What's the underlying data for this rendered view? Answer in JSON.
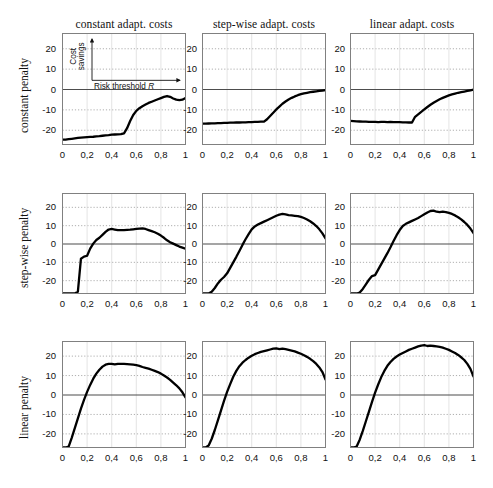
{
  "figure": {
    "col_titles": [
      "constant adapt. costs",
      "step-wise adapt. costs",
      "linear adapt. costs"
    ],
    "row_labels": [
      "constant penalty",
      "step-wise penalty",
      "linear penalty"
    ],
    "ytick_labels": [
      "20",
      "10",
      "0",
      "-10",
      "-20"
    ],
    "xtick_labels": [
      "0",
      "0,2",
      "0,4",
      "0,6",
      "0,8",
      "1"
    ],
    "inset": {
      "ylabel_line1": "Cost",
      "ylabel_line2": "savings",
      "xlabel": "Risk threshold R"
    },
    "colors": {
      "curve": "#000000",
      "axis": "#808080",
      "grid": "#9a9a9a",
      "zero_line": "#4d4d4d",
      "text": "#111111",
      "background": "#ffffff"
    }
  },
  "chart_data": {
    "type": "line",
    "xlabel": "Risk threshold R",
    "ylabel": "Cost savings",
    "xlim": [
      0,
      1
    ],
    "ylim": [
      -27,
      27
    ],
    "xticks": [
      0,
      0.2,
      0.4,
      0.6,
      0.8,
      1
    ],
    "yticks": [
      -20,
      -10,
      0,
      10,
      20
    ],
    "grid": true,
    "legend": "none",
    "grid_rows": [
      "constant penalty",
      "step-wise penalty",
      "linear penalty"
    ],
    "grid_cols": [
      "constant adapt. costs",
      "step-wise adapt. costs",
      "linear adapt. costs"
    ],
    "x": [
      0.0,
      0.025,
      0.05,
      0.075,
      0.1,
      0.125,
      0.15,
      0.175,
      0.2,
      0.225,
      0.25,
      0.275,
      0.3,
      0.325,
      0.35,
      0.375,
      0.4,
      0.425,
      0.45,
      0.475,
      0.5,
      0.525,
      0.55,
      0.575,
      0.6,
      0.625,
      0.65,
      0.675,
      0.7,
      0.725,
      0.75,
      0.775,
      0.8,
      0.825,
      0.85,
      0.875,
      0.9,
      0.925,
      0.95,
      0.975,
      1.0
    ],
    "panels": [
      {
        "row": "constant penalty",
        "col": "constant adapt. costs",
        "values": [
          -24.6,
          -24.6,
          -24.4,
          -24.2,
          -24.0,
          -23.8,
          -23.6,
          -23.5,
          -23.4,
          -23.3,
          -23.2,
          -23.0,
          -22.9,
          -22.7,
          -22.5,
          -22.4,
          -22.2,
          -22.1,
          -22.0,
          -21.9,
          -21.5,
          -19.0,
          -15.5,
          -12.5,
          -10.5,
          -9.2,
          -8.2,
          -7.4,
          -6.6,
          -6.0,
          -5.4,
          -4.8,
          -4.2,
          -3.6,
          -3.2,
          -3.6,
          -4.4,
          -5.0,
          -5.2,
          -5.0,
          -4.2
        ]
      },
      {
        "row": "constant penalty",
        "col": "step-wise adapt. costs",
        "values": [
          -16.8,
          -16.8,
          -16.7,
          -16.6,
          -16.6,
          -16.5,
          -16.5,
          -16.4,
          -16.4,
          -16.3,
          -16.3,
          -16.2,
          -16.2,
          -16.1,
          -16.1,
          -16.0,
          -16.0,
          -15.9,
          -15.9,
          -15.8,
          -15.8,
          -14.6,
          -13.0,
          -11.4,
          -9.8,
          -8.4,
          -7.0,
          -5.9,
          -4.9,
          -4.1,
          -3.4,
          -2.8,
          -2.3,
          -1.9,
          -1.6,
          -1.3,
          -1.1,
          -0.9,
          -0.7,
          -0.5,
          -0.3
        ]
      },
      {
        "row": "constant penalty",
        "col": "linear adapt. costs",
        "values": [
          -15.4,
          -15.5,
          -15.6,
          -15.7,
          -15.8,
          -15.8,
          -15.9,
          -15.9,
          -15.9,
          -16.0,
          -15.9,
          -15.9,
          -16.0,
          -15.9,
          -16.0,
          -16.0,
          -16.0,
          -16.1,
          -16.1,
          -16.2,
          -16.2,
          -13.4,
          -12.2,
          -11.0,
          -9.8,
          -8.6,
          -7.5,
          -6.5,
          -5.6,
          -4.8,
          -4.1,
          -3.5,
          -2.9,
          -2.4,
          -2.0,
          -1.6,
          -1.3,
          -1.0,
          -0.7,
          -0.4,
          -0.1
        ]
      },
      {
        "row": "step-wise penalty",
        "col": "constant adapt. costs",
        "values": [
          -27.0,
          -27.0,
          -27.0,
          -27.0,
          -27.0,
          -26.0,
          -8.0,
          -6.9,
          -6.4,
          -2.5,
          0.2,
          2.2,
          3.4,
          5.0,
          6.6,
          7.9,
          8.2,
          7.9,
          7.6,
          7.6,
          7.6,
          7.7,
          7.8,
          8.0,
          8.2,
          8.4,
          8.5,
          8.2,
          7.6,
          7.0,
          6.4,
          5.6,
          4.6,
          3.4,
          2.0,
          1.0,
          0.2,
          -0.6,
          -1.4,
          -2.0,
          -2.6
        ]
      },
      {
        "row": "step-wise penalty",
        "col": "step-wise adapt. costs",
        "values": [
          -27.0,
          -27.0,
          -27.0,
          -26.0,
          -24.0,
          -21.5,
          -19.5,
          -18.0,
          -16.0,
          -13.0,
          -10.0,
          -7.0,
          -3.8,
          -0.5,
          2.6,
          5.4,
          8.0,
          9.6,
          10.6,
          11.4,
          12.2,
          13.0,
          13.8,
          14.6,
          15.4,
          16.0,
          16.4,
          16.2,
          15.8,
          15.6,
          15.4,
          15.2,
          14.8,
          14.2,
          13.4,
          12.4,
          11.2,
          9.8,
          8.0,
          5.8,
          3.0
        ]
      },
      {
        "row": "step-wise penalty",
        "col": "linear adapt. costs",
        "values": [
          -27.0,
          -27.0,
          -27.0,
          -26.5,
          -24.5,
          -22.0,
          -19.5,
          -17.5,
          -17.0,
          -14.0,
          -11.0,
          -8.0,
          -5.0,
          -1.8,
          1.6,
          4.8,
          7.6,
          9.8,
          11.0,
          11.8,
          12.6,
          13.4,
          14.2,
          15.2,
          16.2,
          17.2,
          18.0,
          18.2,
          17.6,
          17.4,
          17.6,
          17.4,
          17.0,
          16.4,
          15.6,
          14.6,
          13.4,
          12.0,
          10.4,
          8.4,
          6.0
        ]
      },
      {
        "row": "linear penalty",
        "col": "constant adapt. costs",
        "values": [
          -27.0,
          -27.0,
          -26.5,
          -22.0,
          -17.0,
          -12.0,
          -7.0,
          -2.5,
          1.6,
          5.2,
          8.4,
          11.0,
          13.0,
          14.6,
          15.6,
          16.0,
          16.0,
          15.7,
          16.0,
          16.0,
          16.0,
          15.9,
          15.8,
          15.6,
          15.4,
          15.0,
          14.4,
          14.0,
          13.6,
          13.0,
          12.4,
          11.8,
          11.0,
          10.0,
          9.0,
          7.8,
          6.4,
          5.0,
          3.4,
          1.4,
          -1.2
        ]
      },
      {
        "row": "linear penalty",
        "col": "step-wise adapt. costs",
        "values": [
          -27.0,
          -27.0,
          -26.0,
          -22.5,
          -18.0,
          -13.0,
          -8.0,
          -3.0,
          1.6,
          5.6,
          9.4,
          12.4,
          14.8,
          16.6,
          18.0,
          19.2,
          20.2,
          21.0,
          21.6,
          22.2,
          22.6,
          23.0,
          23.4,
          23.8,
          24.0,
          23.6,
          23.8,
          23.6,
          23.2,
          22.8,
          22.4,
          21.8,
          21.2,
          20.4,
          19.6,
          18.6,
          17.4,
          16.0,
          14.2,
          11.8,
          8.0
        ]
      },
      {
        "row": "linear penalty",
        "col": "linear adapt. costs",
        "values": [
          -27.0,
          -27.0,
          -26.5,
          -23.0,
          -18.5,
          -13.5,
          -8.5,
          -3.5,
          1.2,
          5.4,
          9.2,
          12.4,
          15.0,
          17.0,
          18.6,
          19.8,
          20.8,
          21.6,
          22.4,
          23.2,
          23.8,
          24.4,
          25.0,
          25.4,
          25.6,
          25.2,
          25.4,
          25.2,
          25.0,
          24.8,
          24.4,
          23.8,
          23.2,
          22.4,
          21.6,
          20.6,
          19.4,
          18.0,
          16.0,
          13.4,
          9.5
        ]
      }
    ]
  }
}
